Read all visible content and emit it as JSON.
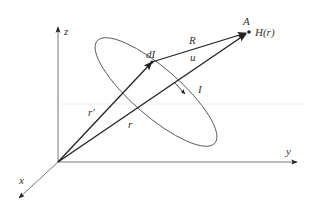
{
  "diagram": {
    "axes": {
      "x_label": "x",
      "y_label": "y",
      "z_label": "z"
    },
    "points": {
      "field_point_label": "A",
      "field_label": "H(r)",
      "element_label": "dI"
    },
    "vectors": {
      "source_position_label": "r′",
      "field_position_label": "r",
      "separation_label": "R",
      "unit_vector_label": "u"
    },
    "loop": {
      "current_label": "I"
    },
    "colors": {
      "ink": "#333333",
      "thin_line": "#555555"
    }
  }
}
